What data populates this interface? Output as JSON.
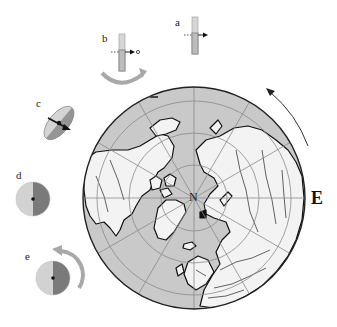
{
  "figure": {
    "type": "polar globe diagram with orientation sub-figures",
    "globe": {
      "projection": "north polar azimuthal",
      "center_label": "N",
      "side_label": "E",
      "rotation_arrow": "counter-clockwise arc at upper right",
      "colors": {
        "ocean": "#c9c9c9",
        "land": "#f3f3f3",
        "outline": "#111111",
        "graticule": "#8a8a8a"
      }
    },
    "subfigures": [
      {
        "label": "a",
        "description": "vertical bar with horizontal dashed arrow through it"
      },
      {
        "label": "b",
        "description": "vertical bar with dashed arrow ending in circle, curved rotation arrow below"
      },
      {
        "label": "c",
        "description": "tilted disc with arrow through center"
      },
      {
        "label": "d",
        "description": "disc split into light and dark halves with center dot"
      },
      {
        "label": "e",
        "description": "split disc with curved rotation arrow"
      }
    ],
    "colors": {
      "light_half": "#d0d0d0",
      "dark_half": "#7a7a7a",
      "arrow_gray": "#a8a8a8",
      "bar_fill": "#c4c4c4",
      "bar_dark": "#8c8c8c"
    }
  }
}
